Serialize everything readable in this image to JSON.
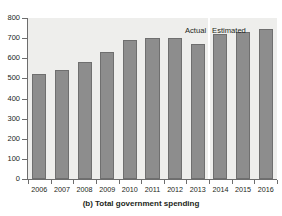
{
  "chart_data": {
    "type": "bar",
    "title": "",
    "caption": "(b) Total government spending",
    "xlabel": "",
    "ylabel": "",
    "categories": [
      "2006",
      "2007",
      "2008",
      "2009",
      "2010",
      "2011",
      "2012",
      "2013",
      "2014",
      "2015",
      "2016"
    ],
    "values": [
      523,
      542,
      582,
      633,
      689,
      700,
      702,
      672,
      719,
      730,
      747
    ],
    "series": [
      {
        "name": "Total government spending",
        "values": [
          523,
          542,
          582,
          633,
          689,
          700,
          702,
          672,
          719,
          730,
          747
        ]
      }
    ],
    "ylim": [
      0,
      800
    ],
    "yticks": [
      0,
      100,
      200,
      300,
      400,
      500,
      600,
      700,
      800
    ],
    "ytick_labels": [
      "0",
      "100",
      "200",
      "300",
      "400",
      "500",
      "600",
      "700",
      "800"
    ],
    "grid": false,
    "legend_position": "none",
    "annotations": [
      {
        "text": "Actual",
        "applies_to": [
          "2006",
          "2007",
          "2008",
          "2009",
          "2010",
          "2011",
          "2012",
          "2013"
        ]
      },
      {
        "text": "Estimated",
        "applies_to": [
          "2014",
          "2015",
          "2016"
        ]
      }
    ],
    "divider_after_category": "2013",
    "colors": {
      "bar_fill": "#8d8d8d",
      "bar_edge": "#6f6f6f",
      "plot_background": "#eeeeec",
      "figure_background": "#ffffff",
      "axis": "#6d6d6d",
      "text": "#231f20",
      "divider": "#ffffff"
    }
  }
}
